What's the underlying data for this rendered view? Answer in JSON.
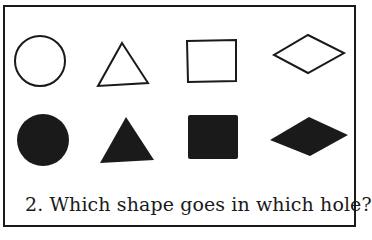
{
  "caption": "2. Which shape goes in which hole?",
  "shapes": {
    "outline": [
      "circle",
      "triangle",
      "square",
      "diamond"
    ],
    "filled": [
      "circle",
      "triangle",
      "square",
      "diamond"
    ]
  },
  "colors": {
    "ink": "#1a1a1a",
    "background": "#ffffff"
  }
}
